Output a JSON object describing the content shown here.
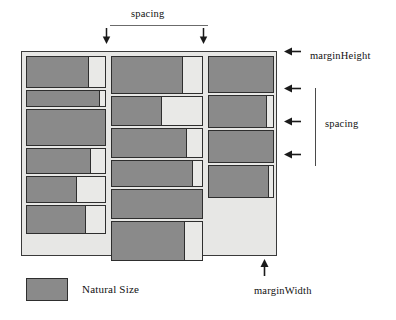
{
  "diagram": {
    "colors": {
      "natural_size_fill": "#8a8a8a",
      "expanded_fill": "#e9e9e7",
      "container_background": "#e7e7e5",
      "stroke": "#2e2e2e",
      "annotation": "#111111"
    },
    "annotations": {
      "top_spacing": "spacing",
      "right_spacing": "spacing",
      "margin_height": "marginHeight",
      "margin_width": "marginWidth"
    },
    "legend": {
      "swatch_label": "Natural Size"
    },
    "container": {
      "columns": [
        {
          "name": "column-1",
          "cells": [
            {
              "height": 32,
              "natural_pct": 80
            },
            {
              "height": 17,
              "natural_pct": 93
            },
            {
              "height": 37,
              "natural_pct": 100
            },
            {
              "height": 26,
              "natural_pct": 82
            },
            {
              "height": 27,
              "natural_pct": 64
            },
            {
              "height": 29,
              "natural_pct": 76
            }
          ]
        },
        {
          "name": "column-2",
          "cells": [
            {
              "height": 38,
              "natural_pct": 79
            },
            {
              "height": 30,
              "natural_pct": 55
            },
            {
              "height": 30,
              "natural_pct": 83
            },
            {
              "height": 27,
              "natural_pct": 90
            },
            {
              "height": 30,
              "natural_pct": 100
            },
            {
              "height": 40,
              "natural_pct": 81
            }
          ]
        },
        {
          "name": "column-3",
          "cells": [
            {
              "height": 37,
              "natural_pct": 100
            },
            {
              "height": 33,
              "natural_pct": 91
            },
            {
              "height": 33,
              "natural_pct": 100
            },
            {
              "height": 33,
              "natural_pct": 93
            }
          ]
        }
      ]
    },
    "arrows": {
      "down": [
        {
          "name": "spacing-arrow-left",
          "x": 106,
          "y": 29
        },
        {
          "name": "spacing-arrow-right",
          "x": 203,
          "y": 29
        }
      ],
      "left": [
        {
          "name": "margin-height-arrow",
          "x": 288,
          "y": 52
        },
        {
          "name": "spacing-arrow-1",
          "x": 288,
          "y": 88
        },
        {
          "name": "spacing-arrow-2",
          "x": 288,
          "y": 120
        },
        {
          "name": "spacing-arrow-3",
          "x": 288,
          "y": 153
        }
      ],
      "up": [
        {
          "name": "margin-width-arrow",
          "x": 264,
          "y": 264
        }
      ]
    }
  }
}
